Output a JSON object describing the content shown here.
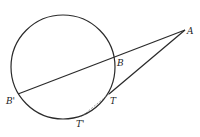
{
  "diagram": {
    "type": "geometry",
    "colors": {
      "stroke": "#2a2a2a",
      "dashed": "#888888",
      "background": "#ffffff"
    },
    "circle": {
      "cx": 63,
      "cy": 67,
      "r": 52
    },
    "points": {
      "A": {
        "label": "A",
        "x": 185,
        "y": 30,
        "lx": 187,
        "ly": 34
      },
      "B": {
        "label": "B",
        "x": 115,
        "y": 58,
        "lx": 117,
        "ly": 66
      },
      "Bp": {
        "label": "B'",
        "x": 18,
        "y": 94,
        "lx": 6,
        "ly": 104
      },
      "T": {
        "label": "T",
        "x": 109,
        "y": 94,
        "lx": 110,
        "ly": 104
      },
      "Tp": {
        "label": "T'",
        "x": 81,
        "y": 117,
        "lx": 76,
        "ly": 127
      }
    },
    "segments": [
      {
        "name": "secant-A-Bprime",
        "from": "A",
        "to": "Bp",
        "style": "solid"
      },
      {
        "name": "tangent-A-T",
        "from": "A",
        "to": "T",
        "style": "solid"
      },
      {
        "name": "chord-T-Tprime",
        "from": "T",
        "to": "Tp",
        "style": "dashed"
      }
    ]
  }
}
